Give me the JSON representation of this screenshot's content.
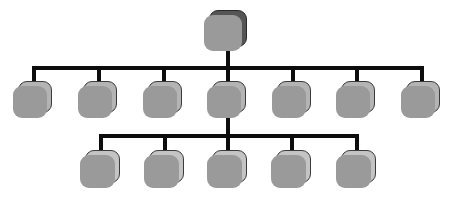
{
  "diagram": {
    "background_color": "#ffffff",
    "edge_color": "#0d0d0d",
    "shadow_color": "#9a9a9a",
    "root_color": "#555555",
    "mid_color": "#b4b4b4",
    "leaf_color": "#c4c4c4",
    "levels": [
      {
        "name": "root",
        "nodes": [
          {
            "label": "1",
            "x": 228,
            "y": 29
          }
        ]
      },
      {
        "name": "children-of-1",
        "nodes": [
          {
            "label": "3",
            "x": 34,
            "y": 97
          },
          {
            "label": "4",
            "x": 99,
            "y": 97
          },
          {
            "label": "5",
            "x": 164,
            "y": 97
          },
          {
            "label": "2",
            "x": 228,
            "y": 97
          },
          {
            "label": "11",
            "x": 293,
            "y": 97
          },
          {
            "label": "12",
            "x": 357,
            "y": 97
          },
          {
            "label": "13",
            "x": 422,
            "y": 97
          }
        ]
      },
      {
        "name": "children-of-2",
        "nodes": [
          {
            "label": "6",
            "x": 101,
            "y": 166
          },
          {
            "label": "7",
            "x": 165,
            "y": 166
          },
          {
            "label": "8",
            "x": 228,
            "y": 166
          },
          {
            "label": "9",
            "x": 292,
            "y": 166
          },
          {
            "label": "10",
            "x": 357,
            "y": 166
          }
        ]
      }
    ],
    "edges": [
      {
        "from": "1",
        "to": "3"
      },
      {
        "from": "1",
        "to": "4"
      },
      {
        "from": "1",
        "to": "5"
      },
      {
        "from": "1",
        "to": "2"
      },
      {
        "from": "1",
        "to": "11"
      },
      {
        "from": "1",
        "to": "12"
      },
      {
        "from": "1",
        "to": "13"
      },
      {
        "from": "2",
        "to": "6"
      },
      {
        "from": "2",
        "to": "7"
      },
      {
        "from": "2",
        "to": "8"
      },
      {
        "from": "2",
        "to": "9"
      },
      {
        "from": "2",
        "to": "10"
      }
    ],
    "caption": ""
  }
}
